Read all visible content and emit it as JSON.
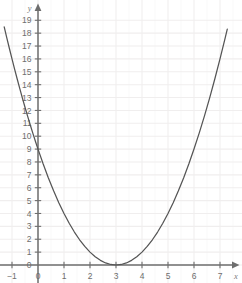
{
  "chart_data": {
    "type": "line",
    "title": "",
    "subtitle": "",
    "xlabel": "x",
    "ylabel": "y",
    "function": "y = (x - 3)^2",
    "grid": true,
    "legend": null,
    "legend_position": "none",
    "xlim": [
      -1.35,
      7.45
    ],
    "ylim": [
      -0.55,
      19.7
    ],
    "xticks": [
      -1,
      0,
      1,
      2,
      3,
      4,
      5,
      6,
      7
    ],
    "yticks": [
      0,
      1,
      2,
      3,
      4,
      5,
      6,
      7,
      8,
      9,
      10,
      11,
      12,
      13,
      14,
      15,
      16,
      17,
      18,
      19
    ],
    "xtick_labels": [
      "−1",
      "0",
      "1",
      "2",
      "3",
      "4",
      "5",
      "6",
      "7"
    ],
    "ytick_labels": [
      "0",
      "1",
      "2",
      "3",
      "4",
      "5",
      "6",
      "7",
      "8",
      "9",
      "10",
      "11",
      "12",
      "13",
      "14",
      "15",
      "16",
      "17",
      "18",
      "19"
    ],
    "vertex": [
      3,
      0
    ],
    "y_intercept": 9,
    "x_intercepts": [
      3
    ],
    "series": [
      {
        "name": "y = (x - 3)^2",
        "color": "#555555",
        "x": [
          -1.3,
          -1.2,
          -1.1,
          -1.0,
          -0.9,
          -0.8,
          -0.7,
          -0.6,
          -0.5,
          -0.4,
          -0.3,
          -0.2,
          -0.1,
          0.0,
          0.2,
          0.4,
          0.6,
          0.8,
          1.0,
          1.2,
          1.4,
          1.6,
          1.8,
          2.0,
          2.2,
          2.4,
          2.6,
          2.8,
          3.0,
          3.2,
          3.4,
          3.6,
          3.8,
          4.0,
          4.2,
          4.4,
          4.6,
          4.8,
          5.0,
          5.2,
          5.4,
          5.6,
          5.8,
          6.0,
          6.2,
          6.4,
          6.6,
          6.8,
          7.0,
          7.2,
          7.28
        ],
        "y": [
          18.49,
          17.64,
          16.81,
          16.0,
          15.21,
          14.44,
          13.69,
          12.96,
          12.25,
          11.56,
          10.89,
          10.24,
          9.61,
          9.0,
          7.84,
          6.76,
          5.76,
          4.84,
          4.0,
          3.24,
          2.56,
          1.96,
          1.44,
          1.0,
          0.64,
          0.36,
          0.16,
          0.04,
          0.0,
          0.04,
          0.16,
          0.36,
          0.64,
          1.0,
          1.44,
          1.96,
          2.56,
          3.24,
          4.0,
          4.84,
          5.76,
          6.76,
          7.84,
          9.0,
          10.24,
          11.56,
          12.96,
          14.44,
          16.0,
          17.64,
          18.32
        ]
      }
    ]
  },
  "axes": {
    "x_axis_name": "x",
    "y_axis_name": "y"
  },
  "colors": {
    "grid": "#f0eeee",
    "axis": "#6e6e6e",
    "curve": "#555555",
    "tick_text": "#6e6e6e",
    "background": "#ffffff"
  }
}
